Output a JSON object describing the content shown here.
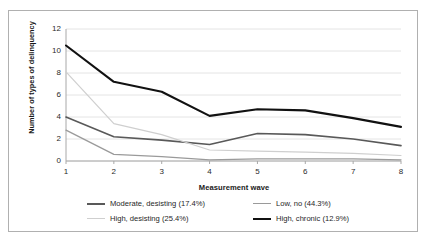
{
  "chart_data": {
    "type": "line",
    "title": "",
    "xlabel": "Measurement wave",
    "ylabel": "Number of types of delinquency",
    "x": [
      1,
      2,
      3,
      4,
      5,
      6,
      7,
      8
    ],
    "categories": [
      "1",
      "2",
      "3",
      "4",
      "5",
      "6",
      "7",
      "8"
    ],
    "xlim": [
      1,
      8
    ],
    "ylim": [
      0,
      12
    ],
    "y_ticks": [
      0,
      2,
      4,
      6,
      8,
      10,
      12
    ],
    "y_tick_labels": [
      "0",
      "2",
      "4",
      "6",
      "8",
      "10",
      "12"
    ],
    "grid": "horizontal",
    "legend_position": "bottom",
    "series": [
      {
        "name": "Moderate, desisting (17.4%)",
        "color": "#595959",
        "width": 1.6,
        "values": [
          4.0,
          2.2,
          1.9,
          1.5,
          2.5,
          2.4,
          2.0,
          1.4
        ]
      },
      {
        "name": "Low, no (44.3%)",
        "color": "#9a9a9a",
        "width": 1.3,
        "values": [
          2.8,
          0.6,
          0.4,
          0.1,
          0.2,
          0.2,
          0.2,
          0.1
        ]
      },
      {
        "name": "High, desisting (25.4%)",
        "color": "#cfcfcf",
        "width": 1.2,
        "values": [
          8.1,
          3.4,
          2.4,
          1.0,
          0.9,
          0.8,
          0.7,
          0.5
        ]
      },
      {
        "name": "High, chronic (12.9%)",
        "color": "#111111",
        "width": 2.1,
        "values": [
          10.5,
          7.2,
          6.3,
          4.1,
          4.7,
          4.6,
          3.9,
          3.1
        ]
      }
    ]
  },
  "legend": {
    "rows": [
      [
        {
          "label": "Moderate, desisting (17.4%)",
          "color": "#595959",
          "width": 2.2,
          "name": "moderate-desisting"
        },
        {
          "label": "Low, no (44.3%)",
          "color": "#9a9a9a",
          "width": 1.6,
          "name": "low-no"
        }
      ],
      [
        {
          "label": "High, desisting (25.4%)",
          "color": "#cfcfcf",
          "width": 1.4,
          "name": "high-desisting"
        },
        {
          "label": "High, chronic (12.9%)",
          "color": "#111111",
          "width": 2.6,
          "name": "high-chronic"
        }
      ]
    ]
  },
  "style": {
    "frame_color": "#b0b0b0",
    "grid_color": "#e4e4e4",
    "axis_color": "#a8a8a8",
    "background": "#ffffff",
    "text_color": "#2b2b2b"
  }
}
